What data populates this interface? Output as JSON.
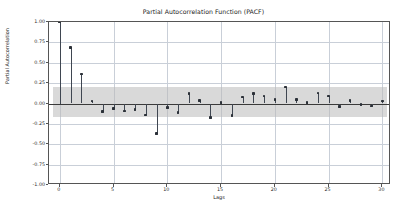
{
  "chart_data": {
    "type": "line",
    "plot_style": "stem",
    "title": "Partial Autocorrelation Function (PACF)",
    "xlabel": "Lags",
    "ylabel": "Partial Autocorrelation",
    "xlim": [
      -1,
      30.8
    ],
    "ylim": [
      -1.0,
      1.0
    ],
    "grid": true,
    "legend": null,
    "xticks": [
      0,
      5,
      10,
      15,
      20,
      25,
      30
    ],
    "xtick_labels": [
      "0",
      "5",
      "10",
      "15",
      "20",
      "25",
      "30"
    ],
    "yticks": [
      1.0,
      0.75,
      0.5,
      0.25,
      0.0,
      -0.25,
      -0.5,
      -0.75,
      -1.0
    ],
    "ytick_labels": [
      "1.00",
      "0.75",
      "0.50",
      "0.25",
      "0.00",
      "-0.25",
      "-0.50",
      "-0.75",
      "-1.00"
    ],
    "confidence_band": {
      "upper": 0.2,
      "lower": -0.16,
      "x_start": -0.6,
      "x_end": 30.4,
      "color": "#b9b9b9",
      "opacity": 0.55
    },
    "stem_color": "#3f4651",
    "marker_color": "#2b3038",
    "x": [
      0,
      1,
      2,
      3,
      4,
      5,
      6,
      7,
      8,
      9,
      10,
      11,
      12,
      13,
      14,
      15,
      16,
      17,
      18,
      19,
      20,
      21,
      22,
      23,
      24,
      25,
      26,
      27,
      28,
      29,
      30
    ],
    "values": [
      1.0,
      0.69,
      0.36,
      0.03,
      -0.1,
      -0.06,
      -0.09,
      -0.07,
      -0.14,
      -0.37,
      -0.05,
      -0.11,
      0.12,
      0.04,
      -0.17,
      0.01,
      -0.15,
      0.08,
      0.12,
      0.09,
      0.05,
      0.2,
      0.05,
      0.01,
      0.13,
      0.09,
      -0.04,
      0.04,
      -0.01,
      -0.03,
      0.03
    ],
    "categories": [
      "0",
      "1",
      "2",
      "3",
      "4",
      "5",
      "6",
      "7",
      "8",
      "9",
      "10",
      "11",
      "12",
      "13",
      "14",
      "15",
      "16",
      "17",
      "18",
      "19",
      "20",
      "21",
      "22",
      "23",
      "24",
      "25",
      "26",
      "27",
      "28",
      "29",
      "30"
    ]
  }
}
